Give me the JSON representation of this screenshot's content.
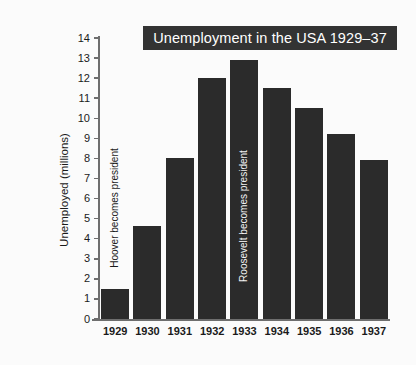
{
  "chart_data": {
    "type": "bar",
    "title": "Unemployment in the USA 1929–37",
    "xlabel": "",
    "ylabel": "Unemployed (millions)",
    "categories": [
      "1929",
      "1930",
      "1931",
      "1932",
      "1933",
      "1934",
      "1935",
      "1936",
      "1937"
    ],
    "values": [
      1.5,
      4.65,
      8.0,
      12.0,
      12.9,
      11.5,
      10.5,
      9.2,
      7.9
    ],
    "ylim": [
      0,
      14
    ],
    "yticks": [
      0,
      1,
      2,
      3,
      4,
      5,
      6,
      7,
      8,
      9,
      10,
      11,
      12,
      13,
      14
    ],
    "ytick_labels": [
      "0",
      "1",
      "2",
      "3",
      "4",
      "5",
      "6",
      "7",
      "8",
      "9",
      "10",
      "11",
      "12",
      "13",
      "14"
    ],
    "grid": false,
    "legend": false,
    "bar_color": "#2b2b2b",
    "annotations": [
      {
        "category": "1929",
        "text": "Hoover becomes president",
        "placement": "above-bar",
        "color": "#1a1a1a"
      },
      {
        "category": "1933",
        "text": "Roosevelt becomes president",
        "placement": "inside-bar",
        "color": "#f2f2f2"
      }
    ]
  },
  "style": {
    "background": "#fbfbfb",
    "title_background": "#333333",
    "title_color": "#ffffff",
    "axis_color": "#6e6e6e",
    "text_color": "#1a1a1a"
  }
}
